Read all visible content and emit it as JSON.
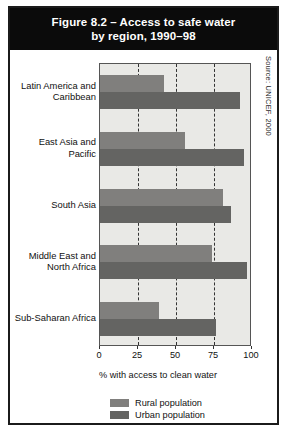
{
  "figure": {
    "title": "Figure 8.2 – Access to safe water\nby region, 1990–98",
    "source": "Source: UNICEF, 2000"
  },
  "chart_data": {
    "type": "bar",
    "orientation": "horizontal",
    "title": "Figure 8.2 – Access to safe water by region, 1990–98",
    "xlabel": "% with access to clean water",
    "ylabel": "",
    "xlim": [
      0,
      100
    ],
    "xticks": [
      0,
      25,
      50,
      75,
      100
    ],
    "gridlines": [
      25,
      50,
      75
    ],
    "grid": true,
    "legend_position": "bottom",
    "categories": [
      "Latin America and\nCaribbean",
      "East Asia and\nPacific",
      "South Asia",
      "Middle East and\nNorth Africa",
      "Sub-Saharan Africa"
    ],
    "series": [
      {
        "name": "Rural population",
        "color": "#807f7d",
        "values": [
          42,
          56,
          81,
          74,
          39
        ]
      },
      {
        "name": "Urban population",
        "color": "#646462",
        "values": [
          92,
          95,
          86,
          97,
          76
        ]
      }
    ]
  },
  "axis": {
    "tick_labels": [
      "0",
      "25",
      "50",
      "75",
      "100"
    ],
    "x_title": "% with access to clean water"
  },
  "legend": {
    "items": [
      {
        "label": "Rural population"
      },
      {
        "label": "Urban population"
      }
    ]
  }
}
